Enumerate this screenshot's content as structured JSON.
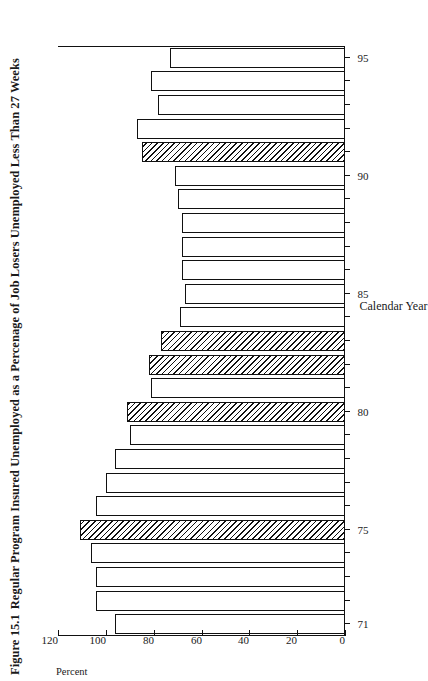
{
  "figure": {
    "number": "Figure 15.1",
    "title": "Regular Program Insured Unemployed as a Percenage of Job Losers Unemployed Less Than 27 Weeks"
  },
  "axes": {
    "value_axis_title": "Percent",
    "category_axis_title": "Calendar Year",
    "value_ticks": [
      "120",
      "100",
      "80",
      "60",
      "40",
      "20",
      "0"
    ],
    "category_ticks": [
      "71",
      "75",
      "80",
      "85",
      "90",
      "95"
    ]
  },
  "colors": {
    "ink": "#111111",
    "paper": "#ffffff",
    "hatch": "#111111"
  },
  "chart_data": {
    "type": "bar",
    "xlabel": "Calendar Year",
    "ylabel": "Percent",
    "ylim": [
      0,
      120
    ],
    "grid": false,
    "legend": "none",
    "orientation": "horizontal",
    "categories": [
      "71",
      "72",
      "73",
      "74",
      "75",
      "76",
      "77",
      "78",
      "79",
      "80",
      "81",
      "82",
      "83",
      "84",
      "85",
      "86",
      "87",
      "88",
      "89",
      "90",
      "91",
      "92",
      "93",
      "94",
      "95"
    ],
    "values": [
      96,
      104,
      104,
      106,
      111,
      104,
      100,
      96,
      90,
      91,
      81,
      82,
      77,
      69,
      67,
      68,
      68,
      68,
      70,
      71,
      85,
      87,
      78,
      81,
      73
    ],
    "bar_styles": [
      "open",
      "open",
      "open",
      "open",
      "hatched",
      "open",
      "open",
      "open",
      "open",
      "hatched",
      "open",
      "hatched",
      "hatched",
      "open",
      "open",
      "open",
      "open",
      "open",
      "open",
      "open",
      "hatched",
      "open",
      "open",
      "open",
      "open"
    ]
  }
}
